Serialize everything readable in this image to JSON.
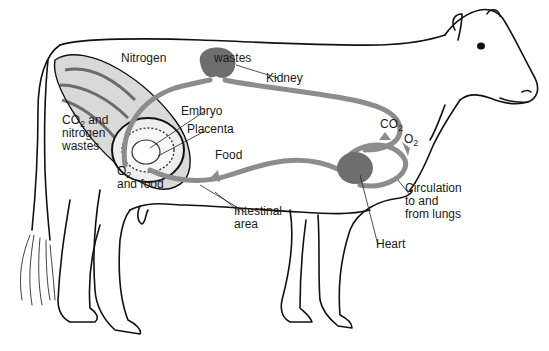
{
  "diagram": {
    "colors": {
      "vessel": "#8c8c8c",
      "organ": "#6e6e6e",
      "outline": "#111111",
      "background": "#ffffff"
    },
    "labels": {
      "nitrogen": "Nitrogen",
      "wastes": "wastes",
      "kidney": "Kidney",
      "embryo": "Embryo",
      "placenta": "Placenta",
      "co2_nitrogen_line1_pre": "CO",
      "co2_nitrogen_line1_sub": "2",
      "co2_nitrogen_line1_post": " and",
      "co2_nitrogen_line2": "nitrogen",
      "co2_nitrogen_line3": "wastes",
      "o2_food_line1_pre": "O",
      "o2_food_line1_sub": "2",
      "o2_food_line2": "and food",
      "food": "Food",
      "intestinal_line1": "Intestinal",
      "intestinal_line2": "area",
      "co2_pre": "CO",
      "co2_sub": "2",
      "o2_pre": "O",
      "o2_sub": "2",
      "circulation_line1": "Circulation",
      "circulation_line2": "to and",
      "circulation_line3": "from lungs",
      "heart": "Heart"
    }
  }
}
